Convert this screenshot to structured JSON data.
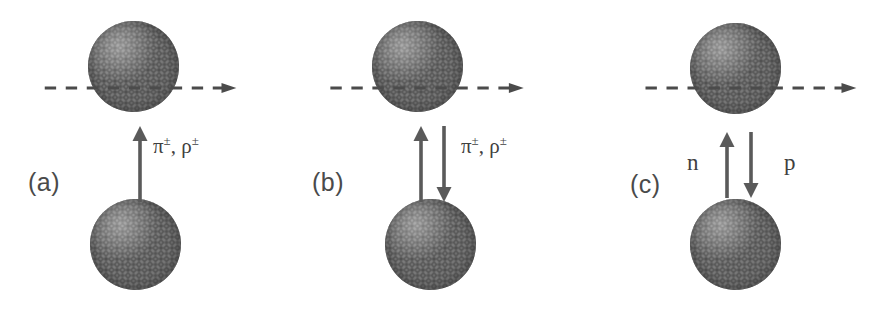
{
  "figure": {
    "background_color": "#ffffff",
    "ink_color": "#3f3f3f",
    "nucleus_color": "#bdbdbd",
    "panels": [
      {
        "id": "a",
        "label": "(a)",
        "beam_icon": "dashed-arrow-right",
        "beam_direction": "right",
        "exchange_arrows": [
          {
            "icon": "arrow-up-icon",
            "direction": "up"
          }
        ],
        "exchange_label_html": "π<sup>±</sup>, ρ<sup>±</sup>",
        "exchange_label_text": "π±, ρ±",
        "nuclei": [
          {
            "position": "top",
            "name": "projectile-nucleus"
          },
          {
            "position": "bottom",
            "name": "target-nucleus"
          }
        ]
      },
      {
        "id": "b",
        "label": "(b)",
        "beam_icon": "dashed-arrow-right",
        "beam_direction": "right",
        "exchange_arrows": [
          {
            "icon": "arrow-up-icon",
            "direction": "up"
          },
          {
            "icon": "arrow-down-icon",
            "direction": "down"
          }
        ],
        "exchange_label_html": "π<sup>±</sup>, ρ<sup>±</sup>",
        "exchange_label_text": "π±, ρ±",
        "nuclei": [
          {
            "position": "top",
            "name": "projectile-nucleus"
          },
          {
            "position": "bottom",
            "name": "target-nucleus"
          }
        ]
      },
      {
        "id": "c",
        "label": "(c)",
        "beam_icon": "dashed-arrow-right",
        "beam_direction": "right",
        "exchange_arrows": [
          {
            "icon": "arrow-up-icon",
            "direction": "up"
          },
          {
            "icon": "arrow-down-icon",
            "direction": "down"
          }
        ],
        "exchange_label_left": "n",
        "exchange_label_right": "p",
        "nuclei": [
          {
            "position": "top",
            "name": "projectile-nucleus"
          },
          {
            "position": "bottom",
            "name": "target-nucleus"
          }
        ]
      }
    ]
  }
}
